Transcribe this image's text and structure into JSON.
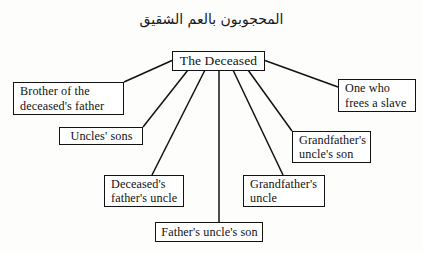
{
  "diagram": {
    "heading": {
      "arabic_text": "المحجوبون بالعم الشقيق",
      "transliteration_meaning": "Those excluded by the full paternal uncle"
    },
    "center_node": {
      "label": "The Deceased",
      "lines": [
        "The Deceased"
      ]
    },
    "nodes": [
      {
        "id": "brother-of-deceaseds-father",
        "lines": [
          "Brother of the",
          "deceased's father"
        ],
        "align": "left"
      },
      {
        "id": "one-who-frees-a-slave",
        "lines": [
          "One who",
          "frees a slave"
        ],
        "align": "left"
      },
      {
        "id": "uncles-sons",
        "lines": [
          "Uncles' sons"
        ],
        "align": "center"
      },
      {
        "id": "grandfathers-uncles-son",
        "lines": [
          "Grandfather's",
          "uncle's son"
        ],
        "align": "left"
      },
      {
        "id": "deceaseds-fathers-uncle",
        "lines": [
          "Deceased's",
          "father's uncle"
        ],
        "align": "left"
      },
      {
        "id": "grandfathers-uncle",
        "lines": [
          "Grandfather's",
          "uncle"
        ],
        "align": "left"
      },
      {
        "id": "fathers-uncles-son",
        "lines": [
          "Father's uncle's son"
        ],
        "align": "center"
      }
    ],
    "colors": {
      "line": "#121214",
      "text": "#121214",
      "background": "#fdfdfc",
      "box_fill": "#ffffff"
    }
  }
}
